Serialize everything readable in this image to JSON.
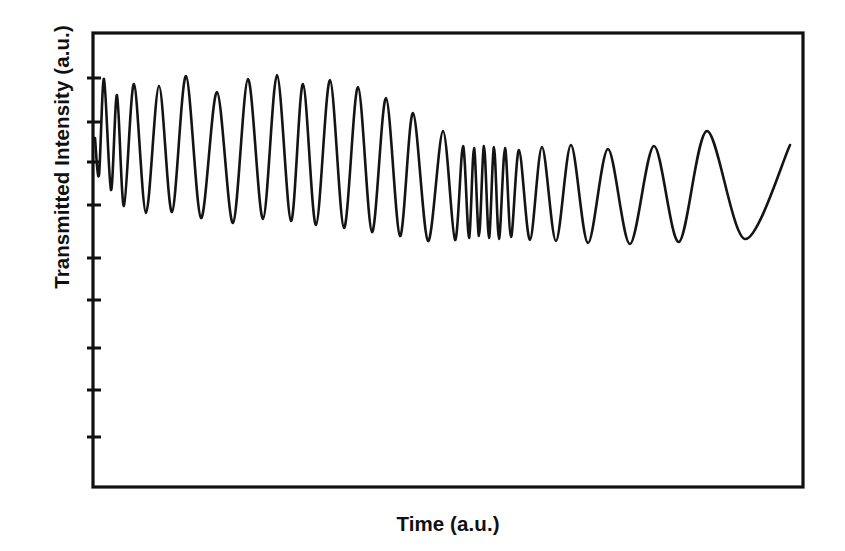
{
  "figure": {
    "name": "interferometric-transmission-trace",
    "background": "#ffffff",
    "line_color": "#141414",
    "axis_color": "#101010"
  },
  "axes": {
    "xlabel": "Time (a.u.)",
    "ylabel": "Transmitted Intensity (a.u.)",
    "frame": {
      "left": 93,
      "right": 803,
      "top": 33,
      "bottom": 487
    },
    "frame_linewidth": 3.2,
    "x_ticks": [],
    "x_tick_labels": [],
    "y_tick_labels": [],
    "y_tick_positions_px": [
      78,
      122,
      162,
      205,
      258,
      300,
      348,
      390,
      437
    ],
    "y_tick_length": 13,
    "y_tick_linewidth": 3.0,
    "tick_side": "both"
  },
  "chart_data": {
    "type": "line",
    "title": "",
    "xlabel": "Time (a.u.)",
    "ylabel": "Transmitted Intensity (a.u.)",
    "grid": false,
    "legend": null,
    "xlim": [
      93,
      803
    ],
    "ylim": [
      487,
      33
    ],
    "axis_units": "pixel",
    "series_name": "transmitted intensity",
    "control_points": [
      {
        "x": 95,
        "y": 138,
        "kind": "start"
      },
      {
        "x": 99,
        "y": 175,
        "kind": "valley"
      },
      {
        "x": 104,
        "y": 79,
        "kind": "peak"
      },
      {
        "x": 111,
        "y": 190,
        "kind": "valley"
      },
      {
        "x": 117,
        "y": 95,
        "kind": "peak"
      },
      {
        "x": 124,
        "y": 206,
        "kind": "valley"
      },
      {
        "x": 134,
        "y": 84,
        "kind": "peak"
      },
      {
        "x": 146,
        "y": 213,
        "kind": "valley"
      },
      {
        "x": 159,
        "y": 86,
        "kind": "peak"
      },
      {
        "x": 172,
        "y": 212,
        "kind": "valley"
      },
      {
        "x": 186,
        "y": 76,
        "kind": "peak"
      },
      {
        "x": 201,
        "y": 218,
        "kind": "valley"
      },
      {
        "x": 217,
        "y": 92,
        "kind": "peak"
      },
      {
        "x": 233,
        "y": 223,
        "kind": "valley"
      },
      {
        "x": 248,
        "y": 79,
        "kind": "peak"
      },
      {
        "x": 263,
        "y": 219,
        "kind": "valley"
      },
      {
        "x": 277,
        "y": 75,
        "kind": "peak"
      },
      {
        "x": 291,
        "y": 221,
        "kind": "valley"
      },
      {
        "x": 303,
        "y": 84,
        "kind": "peak"
      },
      {
        "x": 316,
        "y": 225,
        "kind": "valley"
      },
      {
        "x": 330,
        "y": 80,
        "kind": "peak"
      },
      {
        "x": 344,
        "y": 228,
        "kind": "valley"
      },
      {
        "x": 358,
        "y": 87,
        "kind": "peak"
      },
      {
        "x": 372,
        "y": 232,
        "kind": "valley"
      },
      {
        "x": 386,
        "y": 98,
        "kind": "peak"
      },
      {
        "x": 400,
        "y": 236,
        "kind": "valley"
      },
      {
        "x": 413,
        "y": 113,
        "kind": "peak"
      },
      {
        "x": 428,
        "y": 241,
        "kind": "valley"
      },
      {
        "x": 443,
        "y": 131,
        "kind": "peak"
      },
      {
        "x": 455,
        "y": 240,
        "kind": "valley"
      },
      {
        "x": 463,
        "y": 146,
        "kind": "peak"
      },
      {
        "x": 469,
        "y": 238,
        "kind": "valley"
      },
      {
        "x": 474,
        "y": 148,
        "kind": "peak"
      },
      {
        "x": 479,
        "y": 236,
        "kind": "valley"
      },
      {
        "x": 484,
        "y": 146,
        "kind": "peak"
      },
      {
        "x": 489,
        "y": 238,
        "kind": "valley"
      },
      {
        "x": 494,
        "y": 147,
        "kind": "peak"
      },
      {
        "x": 499,
        "y": 239,
        "kind": "valley"
      },
      {
        "x": 505,
        "y": 148,
        "kind": "peak"
      },
      {
        "x": 511,
        "y": 237,
        "kind": "valley"
      },
      {
        "x": 519,
        "y": 150,
        "kind": "peak"
      },
      {
        "x": 530,
        "y": 240,
        "kind": "valley"
      },
      {
        "x": 542,
        "y": 147,
        "kind": "peak"
      },
      {
        "x": 556,
        "y": 241,
        "kind": "valley"
      },
      {
        "x": 571,
        "y": 145,
        "kind": "peak"
      },
      {
        "x": 588,
        "y": 243,
        "kind": "valley"
      },
      {
        "x": 608,
        "y": 149,
        "kind": "peak"
      },
      {
        "x": 630,
        "y": 244,
        "kind": "valley"
      },
      {
        "x": 654,
        "y": 146,
        "kind": "peak"
      },
      {
        "x": 679,
        "y": 242,
        "kind": "valley"
      },
      {
        "x": 707,
        "y": 131,
        "kind": "peak"
      },
      {
        "x": 745,
        "y": 239,
        "kind": "valley"
      },
      {
        "x": 790,
        "y": 145,
        "kind": "end"
      }
    ],
    "line_width": 2.6,
    "n_fringes_total": 24,
    "burst_region_px": [
      463,
      515
    ],
    "burst_fringe_count": 5
  }
}
